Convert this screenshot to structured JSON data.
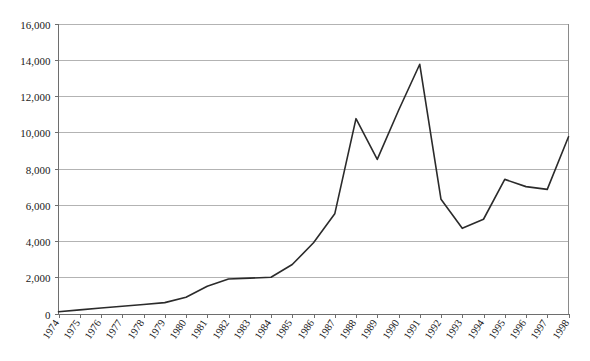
{
  "chart_data": {
    "type": "line",
    "title": "",
    "subtitle": "",
    "xlabel": "",
    "ylabel": "",
    "legend": [],
    "legend_position": "none",
    "grid": true,
    "grid_axis": "y",
    "xlim": [
      1974,
      1998
    ],
    "ylim": [
      0,
      16000
    ],
    "ytick_step": 2000,
    "ytick_labels": [
      "0",
      "2,000",
      "4,000",
      "6,000",
      "8,000",
      "10,000",
      "12,000",
      "14,000",
      "16,000"
    ],
    "ytick_values": [
      0,
      2000,
      4000,
      6000,
      8000,
      10000,
      12000,
      14000,
      16000
    ],
    "categories": [
      "1974",
      "1975",
      "1976",
      "1977",
      "1978",
      "1979",
      "1980",
      "1981",
      "1982",
      "1983",
      "1984",
      "1985",
      "1986",
      "1987",
      "1988",
      "1989",
      "1990",
      "1991",
      "1992",
      "1993",
      "1994",
      "1995",
      "1996",
      "1997",
      "1998"
    ],
    "x": [
      1974,
      1975,
      1976,
      1977,
      1978,
      1979,
      1980,
      1981,
      1982,
      1983,
      1984,
      1985,
      1986,
      1987,
      1988,
      1989,
      1990,
      1991,
      1992,
      1993,
      1994,
      1995,
      1996,
      1997,
      1998
    ],
    "values": [
      100,
      200,
      300,
      400,
      500,
      600,
      900,
      1500,
      1900,
      1950,
      2000,
      2700,
      3900,
      5500,
      10750,
      8500,
      11200,
      13750,
      6300,
      4700,
      5200,
      7400,
      7000,
      6850,
      9750
    ],
    "series": [
      {
        "name": "series-1",
        "color": "#2b2b2b",
        "values": [
          100,
          200,
          300,
          400,
          500,
          600,
          900,
          1500,
          1900,
          1950,
          2000,
          2700,
          3900,
          5500,
          10750,
          8500,
          11200,
          13750,
          6300,
          4700,
          5200,
          7400,
          7000,
          6850,
          9750
        ]
      }
    ],
    "annotations": [],
    "colors": {
      "line": "#2b2b2b",
      "grid": "#b3b3b3",
      "axis": "#6e6e6e",
      "text": "#1a1a1a",
      "background": "#ffffff"
    }
  }
}
